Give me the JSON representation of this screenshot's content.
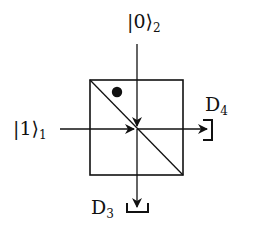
{
  "diagram": {
    "type": "beam-splitter",
    "inputs": [
      {
        "id": "input-1",
        "ket": "1",
        "mode": "1",
        "label": "|1⟩₁",
        "direction": "from-left"
      },
      {
        "id": "input-2",
        "ket": "0",
        "mode": "2",
        "label": "|0⟩₂",
        "direction": "from-top"
      }
    ],
    "detectors": [
      {
        "id": "D4",
        "name": "D",
        "index": "4",
        "position": "right"
      },
      {
        "id": "D3",
        "name": "D",
        "index": "3",
        "position": "bottom"
      }
    ],
    "beam_splitter": {
      "marker": "dot",
      "marker_position": "upper-left"
    },
    "colors": {
      "stroke": "#111111",
      "background": "#ffffff"
    }
  }
}
